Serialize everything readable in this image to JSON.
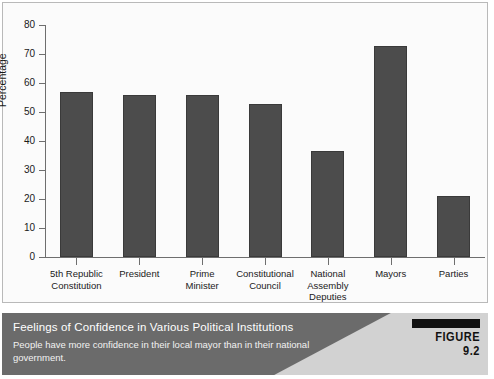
{
  "chart_data": {
    "type": "bar",
    "title": "",
    "xlabel": "",
    "ylabel": "Percentage",
    "ylim": [
      0,
      80
    ],
    "yticks": [
      0,
      10,
      20,
      30,
      40,
      50,
      60,
      70,
      80
    ],
    "grid": false,
    "legend": null,
    "categories": [
      "5th Republic\nConstitution",
      "President",
      "Prime\nMinister",
      "Constitutional\nCouncil",
      "National\nAssembly\nDeputies",
      "Mayors",
      "Parties"
    ],
    "values": [
      57,
      56,
      56,
      52.7,
      36.5,
      72.7,
      21
    ],
    "bar_color": "#4c4c4c"
  },
  "caption": {
    "title": "Feelings of Confidence in Various Political Institutions",
    "subtitle": "People have more confidence in their local mayor than in their national government.",
    "figure_label": "FIGURE 9.2"
  }
}
